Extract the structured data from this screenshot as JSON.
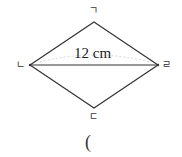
{
  "figure": {
    "shape": "rhombus",
    "vertices": {
      "top": "ㄱ",
      "left": "ㄴ",
      "bottom": "ㄷ",
      "right": "ㄹ"
    },
    "diagonal_label": "12 cm",
    "answer_paren": "("
  }
}
